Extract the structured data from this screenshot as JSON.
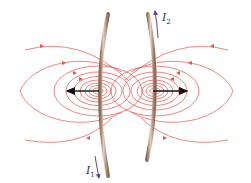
{
  "diagram": {
    "colors": {
      "field_line": "#e8524a",
      "wire_fill": "#c8a690",
      "wire_edge": "#8a6a58",
      "force_arrow": "#111111",
      "current_arrow": "#5a4a8a",
      "label": "#333344"
    },
    "wires": [
      {
        "id": "wire-1",
        "label_main": "I",
        "label_sub": "1",
        "current_direction": "down"
      },
      {
        "id": "wire-2",
        "label_main": "I",
        "label_sub": "2",
        "current_direction": "up"
      }
    ],
    "forces": [
      {
        "on": "wire-1",
        "direction": "left"
      },
      {
        "on": "wire-2",
        "direction": "right"
      }
    ],
    "field_loops_per_wire": 9
  }
}
